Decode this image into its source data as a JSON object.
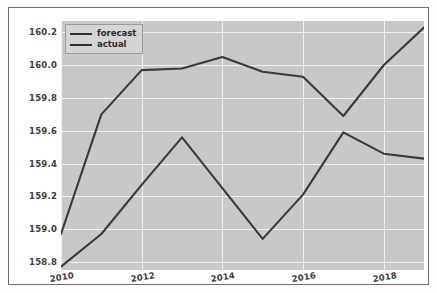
{
  "chart_data": {
    "type": "line",
    "title": "",
    "xlabel": "",
    "ylabel": "",
    "grid": true,
    "legend_position": "upper left",
    "x": [
      2010,
      2011,
      2012,
      2013,
      2014,
      2015,
      2016,
      2017,
      2018,
      2019
    ],
    "xlim": [
      2010,
      2019
    ],
    "ylim": [
      158.75,
      160.27
    ],
    "xticks": [
      "2010",
      "2012",
      "2014",
      "2016",
      "2018"
    ],
    "xtick_values": [
      2010,
      2012,
      2014,
      2016,
      2018
    ],
    "yticks": [
      "158.8",
      "159.0",
      "159.2",
      "159.4",
      "159.6",
      "159.8",
      "160.0",
      "160.2"
    ],
    "ytick_values": [
      158.8,
      159.0,
      159.2,
      159.4,
      159.6,
      159.8,
      160.0,
      160.2
    ],
    "series": [
      {
        "name": "forecast",
        "color": "#3a3a3a",
        "values": [
          158.97,
          159.7,
          159.97,
          159.98,
          160.05,
          159.96,
          159.93,
          159.69,
          160.0,
          160.23
        ]
      },
      {
        "name": "actual",
        "color": "#3a3a3a",
        "values": [
          158.77,
          158.97,
          159.27,
          159.56,
          159.25,
          158.94,
          159.21,
          159.59,
          159.46,
          159.43
        ]
      }
    ]
  },
  "legend": {
    "items": [
      {
        "label": "forecast"
      },
      {
        "label": "actual"
      }
    ]
  },
  "colors": {
    "plot_background": "#c8c8c8",
    "grid": "#f2f2f2",
    "line": "#3a3a3a",
    "figure_border": "#6e6e6e",
    "tick_text": "#3c3c3c"
  }
}
